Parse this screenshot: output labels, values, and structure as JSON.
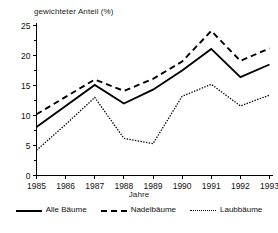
{
  "chart_data": {
    "type": "line",
    "title": "",
    "xlabel": "Jahre",
    "ylabel": "gewichteter Anteil (%)",
    "categories": [
      "1985",
      "1986",
      "1987",
      "1988",
      "1989",
      "1990",
      "1991",
      "1992",
      "1993"
    ],
    "x": [
      1985,
      1986,
      1987,
      1988,
      1989,
      1990,
      1991,
      1992,
      1993
    ],
    "xlim": [
      1985,
      1993
    ],
    "ylim": [
      0,
      25
    ],
    "yticks": [
      0,
      5,
      10,
      15,
      20,
      25
    ],
    "ytick_labels": [
      "0",
      "5",
      "10",
      "15",
      "20",
      "25"
    ],
    "xtick_labels": [
      "1985",
      "1986",
      "1987",
      "1988",
      "1989",
      "1990",
      "1991",
      "1992",
      "1993"
    ],
    "grid": false,
    "legend_position": "below",
    "series": [
      {
        "name": "Alle Bäume",
        "style": "solid",
        "color": "#000000",
        "values": [
          8.1,
          11.6,
          15.1,
          12.0,
          14.3,
          17.5,
          21.1,
          16.4,
          18.5
        ]
      },
      {
        "name": "Nadelbäume",
        "style": "dashed",
        "color": "#000000",
        "values": [
          10.2,
          13.1,
          16.0,
          14.1,
          16.1,
          19.0,
          24.1,
          19.1,
          21.2
        ]
      },
      {
        "name": "Laubbäume",
        "style": "dotted",
        "color": "#000000",
        "values": [
          4.2,
          8.5,
          13.0,
          6.2,
          5.3,
          13.2,
          15.2,
          11.6,
          13.4
        ]
      }
    ]
  },
  "legend": {
    "items": [
      {
        "label": "Alle Bäume",
        "style": "solid"
      },
      {
        "label": "Nadelbäume",
        "style": "dashed"
      },
      {
        "label": "Laubbäume",
        "style": "dotted"
      }
    ]
  }
}
